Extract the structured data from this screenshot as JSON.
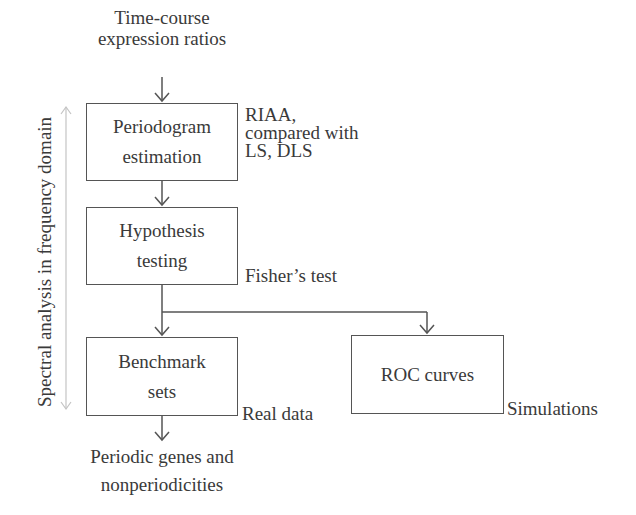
{
  "diagram": {
    "input": {
      "line1": "Time-course",
      "line2": "expression ratios"
    },
    "boxes": [
      {
        "id": "periodogram",
        "line1": "Periodogram",
        "line2": "estimation",
        "annotation": {
          "line1": "RIAA,",
          "line2": "compared with",
          "line3": "LS, DLS"
        }
      },
      {
        "id": "hypothesis",
        "line1": "Hypothesis",
        "line2": "testing",
        "annotation": {
          "line1": "Fisher’s test"
        }
      },
      {
        "id": "benchmark",
        "line1": "Benchmark",
        "line2": "sets",
        "annotation": {
          "line1": "Real data"
        }
      },
      {
        "id": "roc",
        "line1": "ROC curves",
        "annotation": {
          "line1": "Simulations"
        }
      }
    ],
    "output": {
      "line1": "Periodic genes and",
      "line2": "nonperiodicities"
    },
    "side_label": "Spectral analysis in frequency domain",
    "colors": {
      "line": "#555555",
      "side_arrow": "#bbbbbb",
      "text": "#3a3a3a"
    }
  }
}
